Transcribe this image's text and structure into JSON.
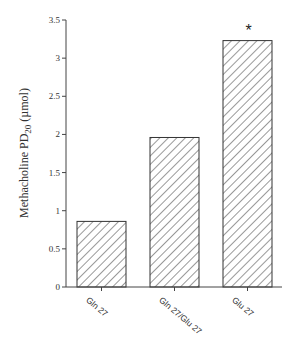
{
  "chart_data": {
    "type": "bar",
    "title": "",
    "xlabel": "",
    "ylabel": "Methacholine PD20 (µmol)",
    "ylabel_main": "Methacholine PD",
    "ylabel_sub": "20",
    "ylabel_unit": " (µmol)",
    "ylim": [
      0,
      3.5
    ],
    "yticks": [
      "0",
      "0.5",
      "1",
      "1.5",
      "2",
      "2.5",
      "3",
      "3.5"
    ],
    "categories": [
      "Gln 27",
      "Gln 27/Glu 27",
      "Glu 27"
    ],
    "values": [
      0.86,
      1.96,
      3.23
    ],
    "annotations": [
      {
        "category": "Glu 27",
        "text": "*"
      }
    ],
    "grid": false,
    "fill": "hatched"
  }
}
